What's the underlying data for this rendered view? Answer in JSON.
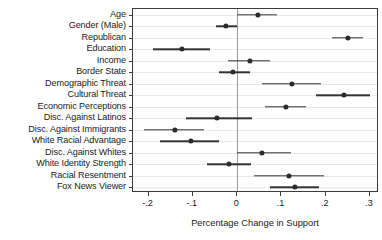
{
  "chart_data": {
    "type": "scatter",
    "title": "",
    "subtitle": "",
    "xlabel": "Percentage Change in Support",
    "ylabel": "",
    "xlim": [
      -0.235,
      0.32
    ],
    "xticks": [
      -0.2,
      -0.1,
      0,
      0.1,
      0.2,
      0.3
    ],
    "xticklabels": [
      "-.2",
      "-.1",
      "0",
      ".1",
      ".2",
      ".3"
    ],
    "grid": true,
    "legend": null,
    "reference_line": 0,
    "categories": [
      "Age",
      "Gender (Male)",
      "Republican",
      "Education",
      "Income",
      "Border State",
      "Demographic Threat",
      "Cultural Threat",
      "Economic Perceptions",
      "Disc. Against Latinos",
      "Disc. Against Immigrants",
      "White Racial Advantage",
      "Disc. Against Whites",
      "White Identity Strength",
      "Racial Resentment",
      "Fox News Viewer"
    ],
    "values": [
      0.046,
      -0.025,
      0.25,
      -0.124,
      0.028,
      -0.01,
      0.124,
      0.24,
      0.11,
      -0.045,
      -0.14,
      -0.105,
      0.055,
      -0.018,
      0.117,
      0.13
    ],
    "ci_low": [
      0.0,
      -0.048,
      0.214,
      -0.19,
      -0.02,
      -0.04,
      0.055,
      0.177,
      0.062,
      -0.115,
      -0.21,
      -0.175,
      0.0,
      -0.068,
      0.038,
      0.075
    ],
    "ci_high": [
      0.09,
      0.0,
      0.285,
      -0.062,
      0.073,
      0.028,
      0.19,
      0.3,
      0.155,
      0.033,
      -0.075,
      -0.04,
      0.122,
      0.032,
      0.195,
      0.185
    ]
  },
  "colors": {
    "point": "#2b2b2b",
    "interval": "#333333",
    "zeroline": "#9a9a9a",
    "gridline": "#e9e9e9",
    "frame": "#3c3c3c",
    "background": "#ffffff",
    "text": "#1a1a1a"
  }
}
